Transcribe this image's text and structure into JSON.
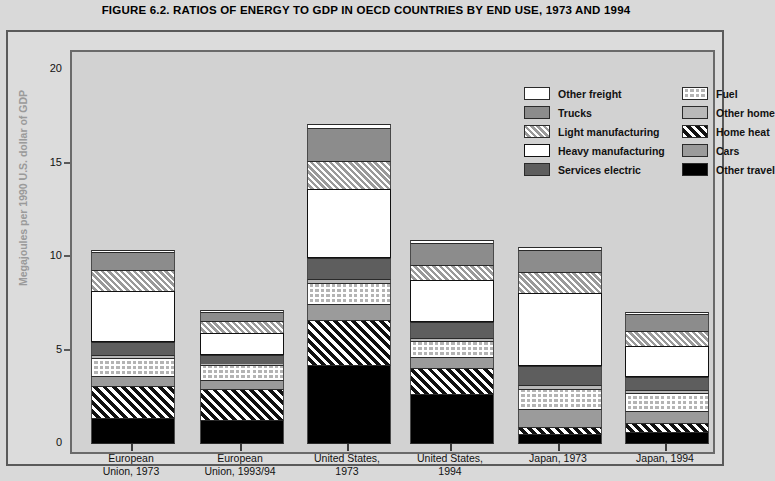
{
  "title": "FIGURE 6.2. RATIOS OF ENERGY TO GDP IN OECD COUNTRIES BY END USE, 1973 AND 1994",
  "colors": {
    "page_background": "#d9d9d9",
    "panel_background": "#dcdcdc",
    "plot_background": "#d2d2d2",
    "axis": "#5a5a5a",
    "axis_title": "#9a9a9a",
    "other_freight": "#ffffff",
    "trucks": "#8c8c8c",
    "light_manufacturing": "#c9c9c9",
    "heavy_manufacturing": "#ffffff",
    "services_electric": "#5e5e5e",
    "fuel": "#b4b4b4",
    "other_home": "#b9b9b9",
    "home_heat": "#1a1a1a",
    "cars": "#9b9b9b",
    "other_travel": "#000000"
  },
  "legend": {
    "columns": [
      [
        {
          "label": "Other freight",
          "key": "other_freight",
          "swatch": "solid-white"
        },
        {
          "label": "Trucks",
          "key": "trucks",
          "swatch": "solid-mid-gray"
        },
        {
          "label": "Light manufacturing",
          "key": "light_manufacturing",
          "swatch": "light-diagonal-hatch"
        },
        {
          "label": "Heavy manufacturing",
          "key": "heavy_manufacturing",
          "swatch": "outlined-white"
        },
        {
          "label": "Services electric",
          "key": "services_electric",
          "swatch": "solid-dark-gray"
        }
      ],
      [
        {
          "label": "Fuel",
          "key": "fuel",
          "swatch": "grid-dot-pattern"
        },
        {
          "label": "Other home",
          "key": "other_home",
          "swatch": "solid-light-gray"
        },
        {
          "label": "Home heat",
          "key": "home_heat",
          "swatch": "black-diagonal-hatch"
        },
        {
          "label": "Cars",
          "key": "cars",
          "swatch": "solid-gray"
        },
        {
          "label": "Other travel",
          "key": "other_travel",
          "swatch": "solid-black"
        }
      ]
    ]
  },
  "chart_data": {
    "type": "bar",
    "subtype": "stacked",
    "title": "FIGURE 6.2. RATIOS OF ENERGY TO GDP IN OECD COUNTRIES BY END USE, 1973 AND 1994",
    "xlabel": "",
    "ylabel": "Megajoules per 1990 U.S. dollar of GDP",
    "ylim": [
      0,
      20
    ],
    "yticks": [
      0,
      5,
      10,
      15,
      20
    ],
    "grid": false,
    "legend_position": "top-right inside plot",
    "categories": [
      "European\nUnion, 1973",
      "European\nUnion, 1993/94",
      "United States,\n1973",
      "United States,\n1994",
      "Japan, 1973",
      "Japan, 1994"
    ],
    "category_labels": [
      [
        "European",
        "Union, 1973"
      ],
      [
        "European",
        "Union, 1993/94"
      ],
      [
        "United States,",
        "1973"
      ],
      [
        "United States,",
        "1994"
      ],
      [
        "Japan, 1973",
        ""
      ],
      [
        "Japan, 1994",
        ""
      ]
    ],
    "stack_order_bottom_to_top": [
      "Other travel",
      "Home heat",
      "Cars",
      "Fuel",
      "Other home",
      "Services electric",
      "Heavy manufacturing",
      "Light manufacturing",
      "Trucks",
      "Other freight"
    ],
    "series": [
      {
        "name": "Other travel",
        "key": "other_travel",
        "values": [
          1.4,
          1.3,
          4.2,
          2.7,
          0.55,
          0.65
        ]
      },
      {
        "name": "Home heat",
        "key": "home_heat",
        "values": [
          1.7,
          1.65,
          2.45,
          1.35,
          0.35,
          0.45
        ]
      },
      {
        "name": "Cars",
        "key": "cars",
        "values": [
          0.55,
          0.45,
          0.85,
          0.6,
          0.95,
          0.65
        ]
      },
      {
        "name": "Fuel",
        "key": "fuel",
        "values": [
          0.95,
          0.8,
          1.1,
          0.85,
          1.1,
          1.0
        ]
      },
      {
        "name": "Other home",
        "key": "other_home",
        "values": [
          0.15,
          0.1,
          0.2,
          0.15,
          0.2,
          0.15
        ]
      },
      {
        "name": "Services electric",
        "key": "services_electric",
        "values": [
          0.7,
          0.45,
          1.15,
          0.9,
          1.0,
          0.7
        ]
      },
      {
        "name": "Heavy manufacturing",
        "key": "heavy_manufacturing",
        "values": [
          2.75,
          1.2,
          3.7,
          2.2,
          3.95,
          1.65
        ]
      },
      {
        "name": "Light manufacturing",
        "key": "light_manufacturing",
        "values": [
          1.1,
          0.65,
          1.5,
          0.8,
          1.1,
          0.8
        ]
      },
      {
        "name": "Trucks",
        "key": "trucks",
        "values": [
          0.95,
          0.45,
          1.75,
          1.2,
          1.2,
          0.9
        ]
      },
      {
        "name": "Other freight",
        "key": "other_freight",
        "values": [
          0.15,
          0.05,
          0.2,
          0.15,
          0.15,
          0.1
        ]
      }
    ],
    "totals": [
      10.4,
      7.1,
      17.1,
      10.9,
      10.55,
      7.05
    ]
  }
}
